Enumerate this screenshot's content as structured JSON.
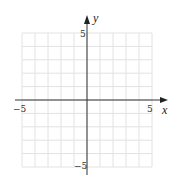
{
  "chart_data": {
    "type": "scatter",
    "title": "",
    "xlabel": "x",
    "ylabel": "y",
    "xlim": [
      -5,
      5
    ],
    "ylim": [
      -5,
      5
    ],
    "grid": true,
    "grid_step": 1,
    "x_ticks_labeled": [
      -5,
      5
    ],
    "y_ticks_labeled": [
      5,
      -5
    ],
    "tick_labels": {
      "x_neg": "−5",
      "x_pos": "5",
      "y_pos": "5",
      "y_neg": "−5"
    },
    "series": [],
    "legend": null
  },
  "colors": {
    "background": "#ffffff",
    "grid": "#e2e2e2",
    "axis": "#333333"
  }
}
